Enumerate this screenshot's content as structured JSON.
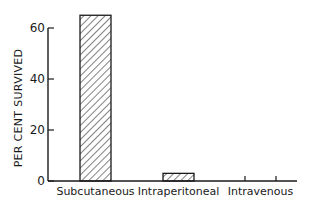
{
  "chart_data": {
    "type": "bar",
    "title": "",
    "xlabel": "",
    "ylabel": "PER CENT SURVIVED",
    "categories": [
      "Subcutaneous",
      "Intraperitoneal",
      "Intravenous"
    ],
    "values": [
      65,
      3,
      0
    ],
    "ylim": [
      0,
      65
    ],
    "yticks": [
      0,
      20,
      40,
      60
    ],
    "ytick_labels": [
      "0",
      "20",
      "40",
      "60"
    ],
    "grid": false,
    "legend": null,
    "bar_fill": "diagonal-hatch",
    "colors": {
      "stroke": "#1a1a1a",
      "background": "#ffffff"
    }
  }
}
